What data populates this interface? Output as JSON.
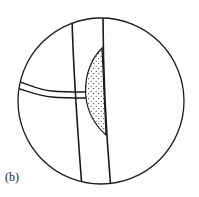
{
  "figure": {
    "panel_label": "(b)",
    "colors": {
      "stroke": "#1a1a1a",
      "fill": "#ffffff",
      "stipple": "#1a1a1a"
    }
  }
}
